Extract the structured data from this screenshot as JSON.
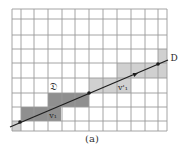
{
  "figure": {
    "caption": "(a)",
    "colors": {
      "background": "#ffffff",
      "grid": "#9a9a9a",
      "dark_shade": "#8f8f8f",
      "light_shade": "#d0d0d0",
      "line": "#1e1e1e",
      "text": "#2a2a2a"
    },
    "grid": {
      "x_lines": [
        12,
        21,
        34,
        48,
        62,
        75,
        89,
        103,
        117,
        131,
        145,
        158,
        167
      ],
      "y_lines": [
        9,
        19,
        35,
        49,
        63,
        78,
        93,
        107,
        121,
        131
      ]
    },
    "shaded_cells": [
      {
        "x": 21,
        "y": 107,
        "w": 40,
        "h": 14,
        "tone": "dark"
      },
      {
        "x": 48,
        "y": 93,
        "w": 41,
        "h": 14,
        "tone": "dark"
      },
      {
        "x": 12,
        "y": 121,
        "w": 9,
        "h": 10,
        "tone": "light"
      },
      {
        "x": 89,
        "y": 78,
        "w": 42,
        "h": 15,
        "tone": "light"
      },
      {
        "x": 117,
        "y": 63,
        "w": 50,
        "h": 15,
        "tone": "light"
      },
      {
        "x": 158,
        "y": 49,
        "w": 9,
        "h": 14,
        "tone": "light"
      }
    ],
    "line": {
      "x1": 10,
      "y1": 127,
      "x2": 168,
      "y2": 60
    },
    "points": [
      {
        "x": 20,
        "y": 122
      },
      {
        "x": 89,
        "y": 93
      },
      {
        "x": 158,
        "y": 64
      }
    ],
    "arrowheads": [
      {
        "x": 138,
        "y": 73
      }
    ],
    "labels": [
      {
        "name": "region-label",
        "text": "𝔇",
        "x": 53,
        "y": 90,
        "size": 10
      },
      {
        "name": "vector-v1-label",
        "text": "v₁",
        "x": 53,
        "y": 118,
        "size": 8
      },
      {
        "name": "vector-v1-prime-label",
        "text": "v'₁",
        "x": 123,
        "y": 90,
        "size": 8
      },
      {
        "name": "line-d-label",
        "text": "D",
        "x": 174,
        "y": 61,
        "size": 9
      }
    ]
  }
}
